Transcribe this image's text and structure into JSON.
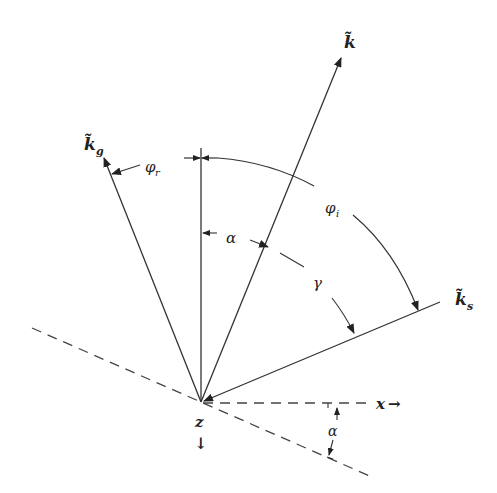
{
  "diagram": {
    "type": "vector-angle-diagram",
    "vectors": [
      {
        "id": "k",
        "label": "k̃",
        "subscript": ""
      },
      {
        "id": "k_g",
        "label": "k̃",
        "subscript": "g"
      },
      {
        "id": "k_s",
        "label": "k̃",
        "subscript": "s"
      }
    ],
    "angles": {
      "phi_r": {
        "symbol": "φ",
        "subscript": "r"
      },
      "phi_i": {
        "symbol": "φ",
        "subscript": "i"
      },
      "alpha": {
        "symbol": "α"
      },
      "gamma": {
        "symbol": "γ"
      },
      "alpha_tilt": {
        "symbol": "α"
      }
    },
    "axes": {
      "x": {
        "label": "x",
        "arrow": "→"
      },
      "z": {
        "label": "z",
        "arrow": "↓"
      }
    },
    "colors": {
      "stroke": "#333333",
      "background": "#ffffff"
    }
  }
}
